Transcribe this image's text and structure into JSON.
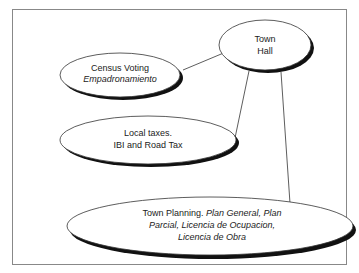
{
  "diagram": {
    "nodes": [
      {
        "id": "town_hall",
        "lines": [
          [
            {
              "text": "Town",
              "italic": false
            }
          ],
          [
            {
              "text": "Hall",
              "italic": false
            }
          ]
        ]
      },
      {
        "id": "census",
        "lines": [
          [
            {
              "text": "Census Voting",
              "italic": false
            }
          ],
          [
            {
              "text": "Empadronamiento",
              "italic": true
            }
          ]
        ]
      },
      {
        "id": "local_taxes",
        "lines": [
          [
            {
              "text": "Local taxes.",
              "italic": false
            }
          ],
          [
            {
              "text": "IBI and Road Tax",
              "italic": false
            }
          ]
        ]
      },
      {
        "id": "town_planning",
        "lines": [
          [
            {
              "text": "Town Planning. ",
              "italic": false
            },
            {
              "text": "Plan General, Plan",
              "italic": true
            }
          ],
          [
            {
              "text": "Parcial, Licencia de Ocupacion,",
              "italic": true
            }
          ],
          [
            {
              "text": "Licencia de Obra",
              "italic": true
            }
          ]
        ]
      }
    ],
    "edges": [
      {
        "from": "town_hall",
        "to": "census"
      },
      {
        "from": "town_hall",
        "to": "local_taxes"
      },
      {
        "from": "town_hall",
        "to": "town_planning"
      }
    ],
    "labels": {
      "th1": "Town",
      "th2": "Hall",
      "c1": "Census Voting",
      "c2": "Empadronamiento",
      "lt1": "Local taxes.",
      "lt2": "IBI and Road Tax",
      "tp1a": "Town Planning. ",
      "tp1b": "Plan General, Plan",
      "tp2": "Parcial, Licencia de Ocupacion,",
      "tp3": "Licencia de Obra"
    }
  }
}
